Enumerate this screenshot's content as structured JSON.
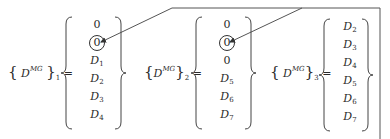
{
  "diagram": {
    "type": "vector-set-assignment",
    "symbol": "D",
    "superscript": "MG",
    "equations": [
      {
        "subscript": "1",
        "entries": [
          {
            "base": "0",
            "sub": "",
            "circled": false
          },
          {
            "base": "0",
            "sub": "",
            "circled": true
          },
          {
            "base": "D",
            "sub": "1",
            "circled": false
          },
          {
            "base": "D",
            "sub": "2",
            "circled": false
          },
          {
            "base": "D",
            "sub": "3",
            "circled": false
          },
          {
            "base": "D",
            "sub": "4",
            "circled": false
          }
        ]
      },
      {
        "subscript": "2",
        "entries": [
          {
            "base": "0",
            "sub": "",
            "circled": false
          },
          {
            "base": "0",
            "sub": "",
            "circled": true
          },
          {
            "base": "0",
            "sub": "",
            "circled": false
          },
          {
            "base": "D",
            "sub": "5",
            "circled": false
          },
          {
            "base": "D",
            "sub": "6",
            "circled": false
          },
          {
            "base": "D",
            "sub": "7",
            "circled": false
          }
        ]
      },
      {
        "subscript": "3",
        "entries": [
          {
            "base": "D",
            "sub": "2",
            "circled": false
          },
          {
            "base": "D",
            "sub": "3",
            "circled": false
          },
          {
            "base": "D",
            "sub": "4",
            "circled": false
          },
          {
            "base": "D",
            "sub": "5",
            "circled": false
          },
          {
            "base": "D",
            "sub": "6",
            "circled": false
          },
          {
            "base": "D",
            "sub": "7",
            "circled": false
          }
        ]
      }
    ],
    "connectors": [
      {
        "from": "right-edge-line",
        "to": "equation-1-circled-zero",
        "arrowhead": true
      },
      {
        "from": "top-line",
        "to": "equation-2-circled-zero",
        "arrowhead": true
      }
    ],
    "colors": {
      "ink": "#2a2a2a",
      "line": "#555555",
      "background": "#ffffff"
    }
  }
}
